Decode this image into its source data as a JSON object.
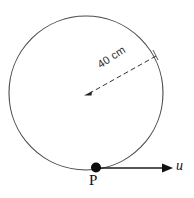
{
  "figure": {
    "background_color": "#ffffff",
    "stroke_color": "#3a3a3a",
    "text_color": "#1b1b1b",
    "width": 194,
    "height": 198,
    "circle": {
      "name": "circle-outline",
      "center_x": 86,
      "center_y": 93,
      "radius": 77,
      "stroke_width": 1
    },
    "radius_arrow": {
      "name": "radius-dashed-arrow",
      "label": "40 cm",
      "from_x": 155,
      "from_y": 57,
      "to_x": 85,
      "to_y": 95,
      "dashed": true,
      "label_rotation_deg": -33
    },
    "point": {
      "name": "point-p",
      "label": "P",
      "x": 96,
      "y": 168,
      "dot_radius": 5
    },
    "velocity_arrow": {
      "name": "velocity-vector",
      "label": "u",
      "from_x": 99,
      "from_y": 168,
      "to_x": 172,
      "to_y": 168
    }
  }
}
